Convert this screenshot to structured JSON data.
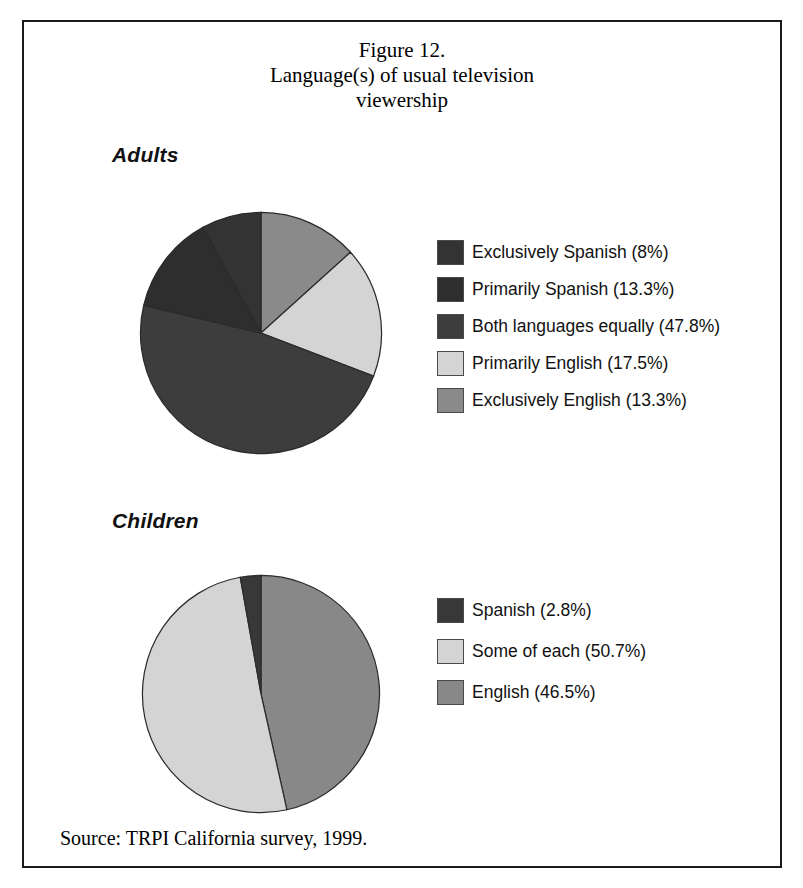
{
  "figure": {
    "title_lines": [
      "Figure 12.",
      "Language(s) of usual television",
      "viewership"
    ],
    "source": "Source: TRPI California survey, 1999.",
    "border_color": "#1a1a1a",
    "background": "#ffffff"
  },
  "sections": {
    "adults": {
      "heading": "Adults"
    },
    "children": {
      "heading": "Children"
    }
  },
  "chart_data": [
    {
      "type": "pie",
      "title": "Adults",
      "figure_title": "Figure 12. Language(s) of usual television viewership",
      "categories": [
        "Exclusively Spanish",
        "Primarily Spanish",
        "Both languages equally",
        "Primarily English",
        "Exclusively English"
      ],
      "values": [
        8,
        13.3,
        47.8,
        17.5,
        13.3
      ],
      "value_unit": "%",
      "legend": [
        {
          "label": "Exclusively Spanish (8%)",
          "value": 8,
          "color": "#333333"
        },
        {
          "label": "Primarily Spanish (13.3%)",
          "value": 13.3,
          "color": "#2e2e2e"
        },
        {
          "label": "Both languages equally (47.8%)",
          "value": 47.8,
          "color": "#3d3d3d"
        },
        {
          "label": "Primarily English (17.5%)",
          "value": 17.5,
          "color": "#d4d4d4"
        },
        {
          "label": "Exclusively English (13.3%)",
          "value": 13.3,
          "color": "#8a8a8a"
        }
      ],
      "legend_position": "right",
      "start_angle_deg": 0,
      "direction": "clockwise",
      "grid": false
    },
    {
      "type": "pie",
      "title": "Children",
      "categories": [
        "Spanish",
        "Some of each",
        "English"
      ],
      "values": [
        2.8,
        50.7,
        46.5
      ],
      "value_unit": "%",
      "legend": [
        {
          "label": "Spanish (2.8%)",
          "value": 2.8,
          "color": "#383838"
        },
        {
          "label": "Some of each (50.7%)",
          "value": 50.7,
          "color": "#d4d4d4"
        },
        {
          "label": "English (46.5%)",
          "value": 46.5,
          "color": "#888888"
        }
      ],
      "legend_position": "right",
      "start_angle_deg": 0,
      "direction": "clockwise",
      "grid": false
    }
  ]
}
